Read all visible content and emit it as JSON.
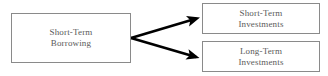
{
  "diagram": {
    "background_color": "#ffffff",
    "node_border_color": "#8a8a8a",
    "node_text_color": "#5a5a5a",
    "connector_color": "#000000",
    "nodes": [
      {
        "id": "source",
        "label": "Short-Term Borrowing",
        "line1": "Short-Term",
        "line2": "Borrowing"
      },
      {
        "id": "short-term-investments",
        "label": "Short-Term Investments",
        "line1": "Short-Term",
        "line2": "Investments"
      },
      {
        "id": "long-term-investments",
        "label": "Long-Term Investments",
        "line1": "Long-Term",
        "line2": "Investments"
      }
    ],
    "connectors": [
      {
        "id": "arrow-to-short-term",
        "from": "source",
        "to": "short-term-investments",
        "style": "solid-arrow"
      },
      {
        "id": "arrow-to-long-term",
        "from": "source",
        "to": "long-term-investments",
        "style": "solid-arrow"
      }
    ]
  }
}
